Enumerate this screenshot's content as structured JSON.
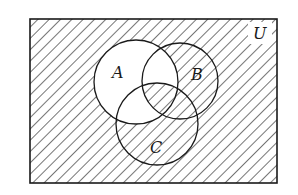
{
  "diagram": {
    "type": "venn",
    "universe_label": "U",
    "sets": [
      {
        "label": "A",
        "cx": 136,
        "cy": 82,
        "r": 42,
        "label_x": 117,
        "label_y": 79
      },
      {
        "label": "B",
        "cx": 180,
        "cy": 81,
        "r": 38,
        "label_x": 197,
        "label_y": 80
      },
      {
        "label": "C",
        "cx": 157,
        "cy": 124,
        "r": 41,
        "label_x": 154,
        "label_y": 154
      }
    ],
    "universe_rect": {
      "x": 30,
      "y": 19,
      "width": 247,
      "height": 164
    },
    "shaded_description": "A' ∪ (A ∩ B ∩ C)",
    "unshaded_regions": [
      "A only",
      "A ∩ B ∩ C'",
      "A ∩ C ∩ B'"
    ],
    "colors": {
      "stroke": "#1a1a1a",
      "hatch": "#2a2a2a",
      "background": "#ffffff"
    }
  }
}
